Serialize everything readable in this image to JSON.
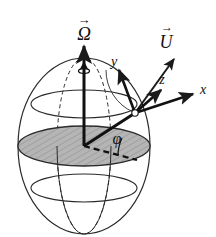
{
  "figure": {
    "name": "rotating-sphere-local-frame-diagram",
    "background": "#ffffff",
    "line_color": "#1a1a1a",
    "disk_fill": "#b3b3b3",
    "disk_hatch": "#8c8c8c",
    "sphere_center": {
      "x": 84,
      "y": 146
    },
    "sphere_radius_x": 66,
    "sphere_radius_y": 88
  },
  "labels": {
    "omega": {
      "symbol": "Ω",
      "accent": "→",
      "name": "rotation-vector-label"
    },
    "u": {
      "symbol": "U",
      "accent": "→",
      "name": "velocity-vector-label"
    },
    "x": {
      "symbol": "x",
      "name": "x-axis-label"
    },
    "y": {
      "symbol": "y",
      "name": "y-axis-label"
    },
    "z": {
      "symbol": "z",
      "name": "z-axis-label"
    },
    "phi": {
      "symbol": "φ",
      "name": "latitude-angle-label"
    }
  },
  "vectors": [
    {
      "id": "omega",
      "label": "Ω",
      "from": [
        84,
        146
      ],
      "to": [
        84,
        44
      ],
      "style": "solid-thick",
      "head": "double"
    },
    {
      "id": "u",
      "label": "U",
      "from": [
        135,
        113
      ],
      "to": [
        175,
        57
      ],
      "style": "solid-thin"
    },
    {
      "id": "x",
      "label": "x",
      "from": [
        135,
        113
      ],
      "to": [
        196,
        93
      ],
      "style": "solid-thick"
    },
    {
      "id": "y",
      "label": "y",
      "from": [
        135,
        113
      ],
      "to": [
        118,
        67
      ],
      "style": "solid-thick"
    },
    {
      "id": "z",
      "label": "z",
      "from": [
        135,
        113
      ],
      "to": [
        163,
        88
      ],
      "style": "solid-thick"
    },
    {
      "id": "radius",
      "label": "",
      "from": [
        84,
        146
      ],
      "to": [
        135,
        113
      ],
      "style": "solid-thick"
    },
    {
      "id": "phi-baseline",
      "label": "",
      "from": [
        84,
        146
      ],
      "to": [
        137,
        159
      ],
      "style": "dashed"
    }
  ],
  "sphere": {
    "latitude_lines": [
      {
        "id": "upper-lat",
        "cy": 104,
        "rx": 53,
        "ry": 14
      },
      {
        "id": "equator",
        "cy": 146,
        "rx": 66,
        "ry": 20
      },
      {
        "id": "lower-lat",
        "cy": 188,
        "rx": 53,
        "ry": 14
      }
    ],
    "meridians": [
      {
        "id": "front-meridian",
        "rx": 27,
        "style": "solid"
      },
      {
        "id": "back-meridian",
        "rx": 27,
        "style": "dashed"
      }
    ],
    "equator_plane": {
      "id": "equatorial-disk",
      "hatched": true
    }
  }
}
